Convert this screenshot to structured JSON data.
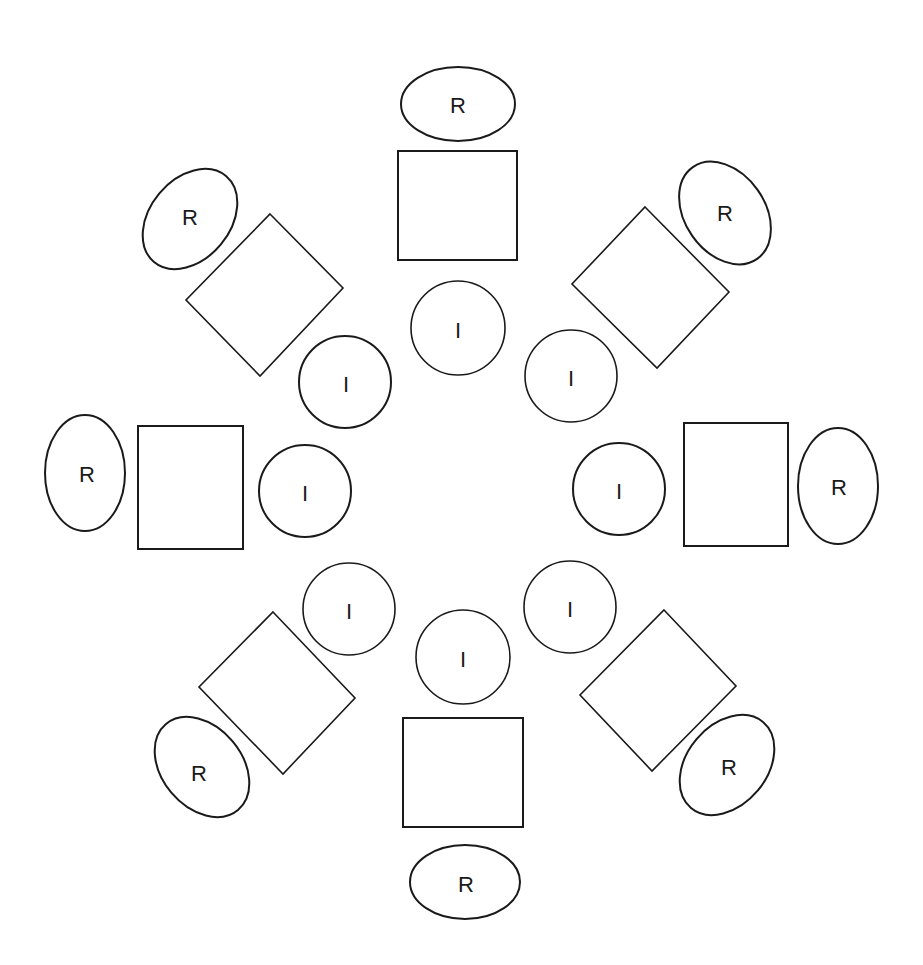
{
  "diagram": {
    "colors": {
      "stroke": "#1a1a1a",
      "background": "#ffffff"
    },
    "labels": {
      "outer": "R",
      "inner": "I"
    },
    "groups": [
      {
        "position": "top",
        "outer_label": "R",
        "inner_label": "I"
      },
      {
        "position": "top-right",
        "outer_label": "R",
        "inner_label": "I"
      },
      {
        "position": "right",
        "outer_label": "R",
        "inner_label": "I"
      },
      {
        "position": "bottom-right",
        "outer_label": "R",
        "inner_label": "I"
      },
      {
        "position": "bottom",
        "outer_label": "R",
        "inner_label": "I"
      },
      {
        "position": "bottom-left",
        "outer_label": "R",
        "inner_label": "I"
      },
      {
        "position": "left",
        "outer_label": "R",
        "inner_label": "I"
      },
      {
        "position": "top-left",
        "outer_label": "R",
        "inner_label": "I"
      }
    ]
  }
}
